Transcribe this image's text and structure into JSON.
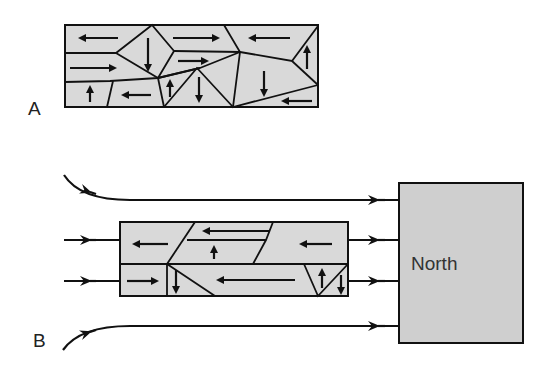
{
  "figure": {
    "panel_a": {
      "label": "A",
      "description": "Rectangular block divided into polygonal fragments, each with an arrow showing random directions of movement"
    },
    "panel_b": {
      "label": "B",
      "north_label": "North",
      "description": "Flow lines from a North source pass to the west; the fragmented block now shows mostly westward-pointing arrows"
    },
    "colors": {
      "fill_gray": "#d9d9d9",
      "north_fill": "#cfcfcf",
      "line": "#111111",
      "background": "#ffffff"
    }
  }
}
